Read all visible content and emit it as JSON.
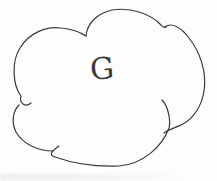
{
  "canvas": {
    "width_px": 217,
    "height_px": 181,
    "paper_color": "#fdfdfd"
  },
  "sketch": {
    "kind": "hand-drawn cloud outline",
    "label": "G",
    "ink_color": "#3a3a3a"
  }
}
